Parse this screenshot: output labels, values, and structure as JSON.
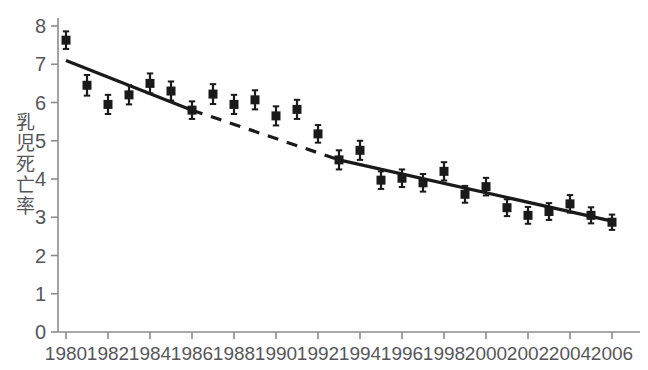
{
  "chart_data": {
    "type": "scatter",
    "title": "",
    "subtitle": "",
    "xlabel": "",
    "ylabel": "乳児死亡率",
    "xlim": [
      1979.2,
      2006.9
    ],
    "ylim": [
      0,
      8
    ],
    "grid": false,
    "legend": "none",
    "x_tick_labels": [
      "1980",
      "1982",
      "1984",
      "1986",
      "1988",
      "1990",
      "1992",
      "1994",
      "1996",
      "1998",
      "2000",
      "2002",
      "2004",
      "2006"
    ],
    "x_ticks": [
      1980,
      1982,
      1984,
      1986,
      1988,
      1990,
      1992,
      1994,
      1996,
      1998,
      2000,
      2002,
      2004,
      2006
    ],
    "y_tick_labels": [
      "0",
      "1",
      "2",
      "3",
      "4",
      "5",
      "6",
      "7",
      "8"
    ],
    "y_ticks": [
      0,
      1,
      2,
      3,
      4,
      5,
      6,
      7,
      8
    ],
    "x": [
      1980,
      1981,
      1982,
      1983,
      1984,
      1985,
      1986,
      1987,
      1988,
      1989,
      1990,
      1991,
      1992,
      1993,
      1994,
      1995,
      1996,
      1997,
      1998,
      1999,
      2000,
      2001,
      2002,
      2003,
      2004,
      2005,
      2006
    ],
    "values": [
      7.63,
      6.45,
      5.95,
      6.2,
      6.5,
      6.3,
      5.8,
      6.22,
      5.95,
      6.07,
      5.65,
      5.82,
      5.18,
      4.5,
      4.75,
      3.97,
      4.02,
      3.9,
      4.2,
      3.6,
      3.8,
      3.25,
      3.05,
      3.15,
      3.35,
      3.05,
      2.87
    ],
    "error_low": [
      7.4,
      6.18,
      5.7,
      5.95,
      6.24,
      6.05,
      5.57,
      5.96,
      5.7,
      5.82,
      5.4,
      5.57,
      4.95,
      4.25,
      4.5,
      3.74,
      3.79,
      3.67,
      3.96,
      3.38,
      3.57,
      3.03,
      2.83,
      2.93,
      3.12,
      2.84,
      2.67
    ],
    "error_high": [
      7.86,
      6.72,
      6.2,
      6.45,
      6.76,
      6.55,
      6.03,
      6.48,
      6.2,
      6.32,
      5.9,
      6.07,
      5.41,
      4.75,
      5.0,
      4.2,
      4.25,
      4.13,
      4.44,
      3.82,
      4.03,
      3.47,
      3.27,
      3.37,
      3.58,
      3.26,
      3.07
    ],
    "series": [
      {
        "name": "infant-mortality-rate",
        "marker": "square",
        "color": "#1a1a1a",
        "values": [
          7.63,
          6.45,
          5.95,
          6.2,
          6.5,
          6.3,
          5.8,
          6.22,
          5.95,
          6.07,
          5.65,
          5.82,
          5.18,
          4.5,
          4.75,
          3.97,
          4.02,
          3.9,
          4.2,
          3.6,
          3.8,
          3.25,
          3.05,
          3.15,
          3.35,
          3.05,
          2.87
        ]
      }
    ],
    "trend_segments": [
      {
        "name": "pre-period-fit",
        "style": "solid",
        "x0": 1980,
        "y0": 7.1,
        "x1": 1986,
        "y1": 5.8
      },
      {
        "name": "intervention-period-projection",
        "style": "dashed",
        "x0": 1986,
        "y0": 5.8,
        "x1": 1993,
        "y1": 4.5
      },
      {
        "name": "post-period-fit",
        "style": "solid",
        "x0": 1993,
        "y0": 4.5,
        "x1": 2006,
        "y1": 2.9
      }
    ],
    "axis_color": "#8c8c90",
    "tick_label_color": "#56565a",
    "marker_color": "#1a1a1a",
    "trend_color": "#1a1a1a"
  }
}
